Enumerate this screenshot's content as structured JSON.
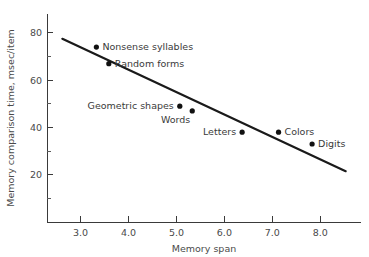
{
  "chart_data": {
    "type": "scatter",
    "title": "",
    "xlabel": "Memory span",
    "ylabel": "Memory comparison time, msec/item",
    "xlim": [
      2.3,
      8.85
    ],
    "ylim": [
      0,
      88
    ],
    "grid": false,
    "legend": "none",
    "x_ticks": [
      "3.0",
      "4.0",
      "5.0",
      "6.0",
      "7.0",
      "8.0"
    ],
    "x_tick_values": [
      3.0,
      4.0,
      5.0,
      6.0,
      7.0,
      8.0
    ],
    "x_minor_ticks": [
      2.5,
      3.5,
      4.5,
      5.5,
      6.5,
      7.5,
      8.5
    ],
    "y_ticks": [
      "20",
      "40",
      "60",
      "80"
    ],
    "y_tick_values": [
      20,
      40,
      60,
      80
    ],
    "y_minor_ticks": [
      10,
      30,
      50,
      70
    ],
    "points": [
      {
        "label": "Nonsense syllables",
        "x": 3.33,
        "y": 74,
        "label_side": "right"
      },
      {
        "label": "Random forms",
        "x": 3.59,
        "y": 67,
        "label_side": "right"
      },
      {
        "label": "Geometric shapes",
        "x": 5.07,
        "y": 49,
        "label_side": "left"
      },
      {
        "label": "Words",
        "x": 5.33,
        "y": 47,
        "label_side": "below-left"
      },
      {
        "label": "Letters",
        "x": 6.37,
        "y": 38,
        "label_side": "left"
      },
      {
        "label": "Colors",
        "x": 7.13,
        "y": 38,
        "label_side": "right"
      },
      {
        "label": "Digits",
        "x": 7.83,
        "y": 33,
        "label_side": "right"
      }
    ],
    "trend_line": {
      "x1": 2.62,
      "y1": 77.5,
      "x2": 8.53,
      "y2": 21.5,
      "note": "least-squares fit line"
    },
    "colors": {
      "line": "#1a1a1a",
      "dot": "#111111",
      "axis": "#3a3a3a",
      "text": "#4a4a4a",
      "background": "#ffffff"
    }
  }
}
